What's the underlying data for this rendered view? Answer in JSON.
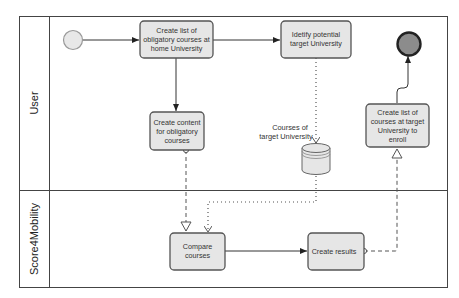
{
  "diagram": {
    "type": "BPMN process",
    "lanes": [
      {
        "id": "user",
        "label": "User"
      },
      {
        "id": "score",
        "label": "Score4Mobility"
      }
    ],
    "events": {
      "start": {
        "label": ""
      },
      "end": {
        "label": ""
      }
    },
    "tasks": {
      "t1": {
        "lines": [
          "Create list of",
          "obligatory courses at",
          "home University"
        ]
      },
      "t2": {
        "lines": [
          "Idetify potential",
          "target University"
        ]
      },
      "t3": {
        "lines": [
          "Create content",
          "for obligatory",
          "courses"
        ]
      },
      "t4": {
        "lines": [
          "Create list of",
          "courses at target",
          "University to",
          "enroll"
        ]
      },
      "t5": {
        "lines": [
          "Compare",
          "courses"
        ]
      },
      "t6": {
        "lines": [
          "Create results"
        ]
      }
    },
    "datastore": {
      "lines": [
        "Courses of",
        "target University"
      ]
    },
    "colors": {
      "task_fill": "#e6e6e6",
      "start_fill": "#e8e8e8",
      "end_fill": "#8c8c8c",
      "stroke": "#555555"
    }
  }
}
